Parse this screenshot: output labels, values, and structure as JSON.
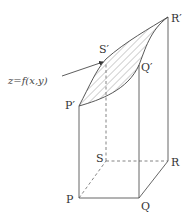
{
  "figure": {
    "surface_label": "z=f(x,y)",
    "points": {
      "P": {
        "label": "P"
      },
      "Q": {
        "label": "Q"
      },
      "R": {
        "label": "R"
      },
      "S": {
        "label": "S"
      },
      "P_top": {
        "label": "P′"
      },
      "Q_top": {
        "label": "Q′"
      },
      "R_top": {
        "label": "R′"
      },
      "S_top": {
        "label": "S′"
      }
    },
    "colors": {
      "line": "#555555",
      "hatch": "#777777"
    }
  }
}
